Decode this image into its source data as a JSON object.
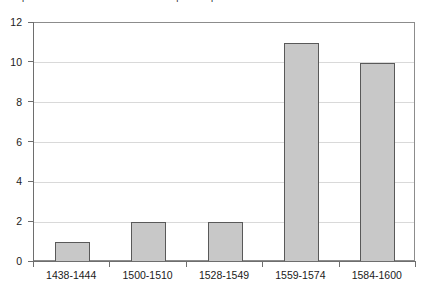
{
  "chart_data": {
    "type": "bar",
    "title": "Graph of absolute number of bedrooms per sample/office",
    "xlabel": "",
    "ylabel": "",
    "categories": [
      "1438-1444",
      "1500-1510",
      "1528-1549",
      "1559-1574",
      "1584-1600"
    ],
    "values": [
      1,
      2,
      2,
      11,
      10
    ],
    "ylim": [
      0,
      12
    ],
    "yticks": [
      "0",
      "2",
      "4",
      "6",
      "8",
      "10",
      "12"
    ],
    "ytick_values": [
      0,
      2,
      4,
      6,
      8,
      10,
      12
    ],
    "grid": true,
    "legend": false,
    "colors": {
      "bar_fill": "#c8c8c8",
      "bar_border": "#595959",
      "gridline": "#d9d9d9",
      "axis": "#6e6e6e",
      "plot_border": "#8c8c8c",
      "text": "#1a1a1a",
      "background": "#ffffff"
    }
  }
}
